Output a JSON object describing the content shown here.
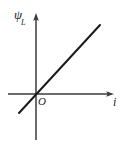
{
  "figure": {
    "background_color": "#ffffff",
    "width": 129,
    "height": 147,
    "origin_label": "O",
    "y_axis_label_symbol": "ψ",
    "y_axis_label_subscript": "L",
    "x_axis_label": "i"
  },
  "chart_data": {
    "type": "line",
    "title": "",
    "subtitle": "",
    "xlabel": "i",
    "ylabel": "ψL",
    "origin_label": "O",
    "grid": false,
    "legend": null,
    "axis_style": {
      "x_axis_arrow": true,
      "y_axis_arrow": true,
      "axis_color": "#3a3a3a",
      "line_color": "#1a1a1a",
      "line_width_px": 2
    },
    "axis_ranges": {
      "x_pixels": [
        8,
        113
      ],
      "y_pixels": [
        140,
        14
      ],
      "origin_pixel": [
        36,
        94
      ]
    },
    "tick_labels": {
      "x": [],
      "y": []
    },
    "series": [
      {
        "name": "ψL versus i",
        "relationship": "linear through origin, positive slope",
        "x": [
          -0.36,
          0.0,
          1.0
        ],
        "y": [
          -0.39,
          0.0,
          1.09
        ],
        "endpoints_pixels": [
          [
            19,
            113
          ],
          [
            100,
            25
          ]
        ]
      }
    ],
    "annotations": [
      {
        "text": "ψ",
        "subscript": "L",
        "role": "y-axis-label",
        "pixel": [
          14,
          8
        ]
      },
      {
        "text": "i",
        "role": "x-axis-label",
        "pixel": [
          113,
          96
        ]
      },
      {
        "text": "O",
        "role": "origin-label",
        "pixel": [
          38,
          96
        ]
      }
    ]
  }
}
